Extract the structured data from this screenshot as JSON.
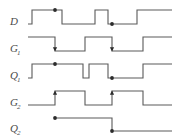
{
  "figure": {
    "kind": "digital-timing-diagram",
    "title": "",
    "width": 184,
    "height": 138,
    "background_color": "#ffffff",
    "trace_color": "#5a5a5a",
    "marker_color": "#2b2b2b",
    "label_color": "#4a4a4a",
    "time_start": 28,
    "time_end": 172
  },
  "signals": [
    {
      "name": "D",
      "label_base": "D",
      "label_sub": "",
      "row_top": 10,
      "row_bottom": 24,
      "initial_level": 0,
      "transitions": [
        {
          "x": 32,
          "to": 1
        },
        {
          "x": 62,
          "to": 0
        },
        {
          "x": 95,
          "to": 1
        },
        {
          "x": 108,
          "to": 0
        },
        {
          "x": 137,
          "to": 1
        }
      ],
      "markers": [
        {
          "type": "dot",
          "x": 55,
          "level": 1
        },
        {
          "type": "dot",
          "x": 112,
          "level": 0
        }
      ]
    },
    {
      "name": "G1",
      "label_base": "G",
      "label_sub": "1",
      "row_top": 37,
      "row_bottom": 51,
      "initial_level": 1,
      "transitions": [
        {
          "x": 55,
          "to": 0
        },
        {
          "x": 85,
          "to": 1
        },
        {
          "x": 112,
          "to": 0
        },
        {
          "x": 143,
          "to": 1
        }
      ],
      "markers": [
        {
          "type": "arrow-down",
          "x": 55
        },
        {
          "type": "arrow-down",
          "x": 112
        }
      ]
    },
    {
      "name": "Q1",
      "label_base": "Q",
      "label_sub": "1",
      "row_top": 64,
      "row_bottom": 78,
      "initial_level": 0,
      "transitions": [
        {
          "x": 32,
          "to": 1
        },
        {
          "x": 83,
          "to": 0
        },
        {
          "x": 89,
          "to": 1
        },
        {
          "x": 108,
          "to": 0
        },
        {
          "x": 143,
          "to": 1
        }
      ],
      "markers": [
        {
          "type": "dot",
          "x": 55,
          "level": 1
        },
        {
          "type": "dot",
          "x": 112,
          "level": 0
        }
      ]
    },
    {
      "name": "G2",
      "label_base": "G",
      "label_sub": "2",
      "row_top": 91,
      "row_bottom": 105,
      "initial_level": 0,
      "transitions": [
        {
          "x": 55,
          "to": 1
        },
        {
          "x": 85,
          "to": 0
        },
        {
          "x": 112,
          "to": 1
        },
        {
          "x": 143,
          "to": 0
        }
      ],
      "markers": [
        {
          "type": "arrow-up",
          "x": 55
        },
        {
          "type": "arrow-up",
          "x": 112
        }
      ]
    },
    {
      "name": "Q2",
      "label_base": "Q",
      "label_sub": "2",
      "row_top": 118,
      "row_bottom": 131,
      "initial_level": 1,
      "start_x": 55,
      "transitions": [
        {
          "x": 112,
          "to": 0
        }
      ],
      "markers": [
        {
          "type": "dot",
          "x": 55,
          "level": 1
        },
        {
          "type": "dot",
          "x": 112,
          "level": 0
        }
      ]
    }
  ],
  "labels": {
    "column_x": 10,
    "subscript_dx": 7,
    "subscript_dy": 3
  }
}
